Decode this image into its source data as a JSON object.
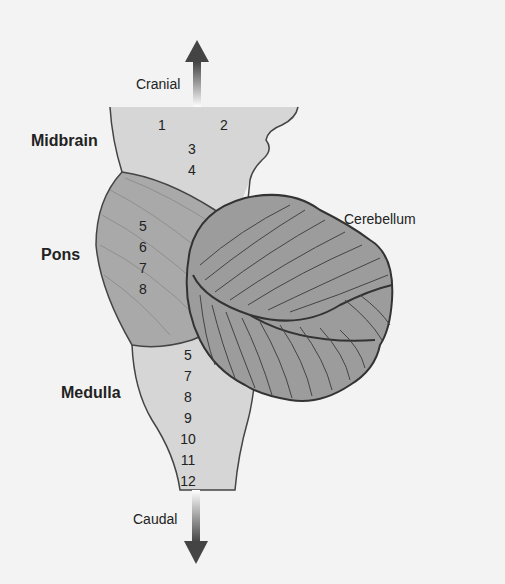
{
  "diagram": {
    "type": "anatomical",
    "colors": {
      "background": "#f3f3f3",
      "midbrain_medulla_fill": "#d6d6d6",
      "pons_fill": "#a9a9a9",
      "cerebellum_fill": "#9c9c9c",
      "outline": "#333333",
      "arrow": "#444444"
    },
    "orientation": {
      "top": "Cranial",
      "bottom": "Caudal"
    },
    "regions": [
      {
        "name": "Midbrain",
        "nerves": [
          "1",
          "2",
          "3",
          "4"
        ]
      },
      {
        "name": "Pons",
        "nerves": [
          "5",
          "6",
          "7",
          "8"
        ]
      },
      {
        "name": "Medulla",
        "nerves": [
          "5",
          "7",
          "8",
          "9",
          "10",
          "11",
          "12"
        ]
      }
    ],
    "structures": [
      "Cerebellum"
    ]
  },
  "labels": {
    "cranial": "Cranial",
    "caudal": "Caudal",
    "midbrain": "Midbrain",
    "pons": "Pons",
    "medulla": "Medulla",
    "cerebellum": "Cerebellum"
  },
  "numbers": {
    "midbrain": [
      "1",
      "2",
      "3",
      "4"
    ],
    "pons": [
      "5",
      "6",
      "7",
      "8"
    ],
    "medulla": [
      "5",
      "7",
      "8",
      "9",
      "10",
      "11",
      "12"
    ]
  }
}
